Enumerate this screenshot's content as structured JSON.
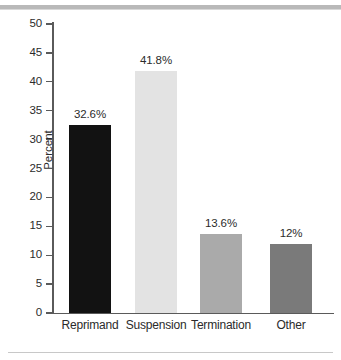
{
  "figure": {
    "background_color": "#ffffff",
    "top_rule_color": "#b9b9b9",
    "bottom_rule_color": "#c8c8c8",
    "axis_color": "#5a5a5a",
    "text_color": "#2b2b2b"
  },
  "chart_data": {
    "type": "bar",
    "title": "",
    "subtitle": "",
    "xlabel": "",
    "ylabel": "Percent",
    "ylim": [
      0,
      50
    ],
    "yticks": [
      0,
      5,
      10,
      15,
      20,
      25,
      30,
      35,
      40,
      45,
      50
    ],
    "ytick_labels": [
      "0",
      "5",
      "10",
      "15",
      "20",
      "25",
      "30",
      "35",
      "40",
      "45",
      "50"
    ],
    "grid": false,
    "legend": "none",
    "categories": [
      "Reprimand",
      "Suspension",
      "Termination",
      "Other"
    ],
    "values": [
      32.6,
      41.8,
      13.6,
      12
    ],
    "data_labels": [
      "32.6%",
      "41.8%",
      "13.6%",
      "12%"
    ],
    "bar_colors": [
      "#121212",
      "#e3e3e3",
      "#aaaaaa",
      "#7a7a7a"
    ],
    "series": [
      {
        "name": "Percent",
        "values": [
          32.6,
          41.8,
          13.6,
          12
        ]
      }
    ]
  }
}
